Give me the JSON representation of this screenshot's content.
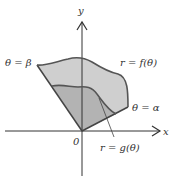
{
  "diagram": {
    "axes": {
      "x_label": "x",
      "y_label": "y",
      "origin_label": "0"
    },
    "labels": {
      "theta_beta": "θ = β",
      "theta_alpha": "θ = α",
      "outer_curve": "r = f(θ)",
      "inner_curve": "r = g(θ)"
    },
    "colors": {
      "region_fill": "#c8c8c8",
      "inner_fill": "#b0b0b0",
      "curve_stroke": "#555555",
      "axis_stroke": "#333333"
    }
  }
}
